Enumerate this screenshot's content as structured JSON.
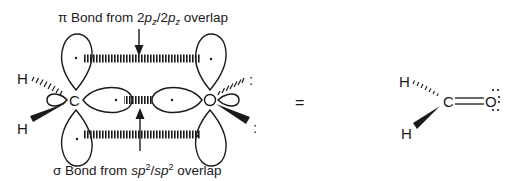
{
  "figure": {
    "pi_label": {
      "prefix": "π Bond from 2",
      "p1": "p",
      "sub1": "z",
      "slash": "/2",
      "p2": "p",
      "sub2": "z",
      "suffix": " overlap"
    },
    "sigma_label": {
      "prefix": "σ Bond from ",
      "sp1": "sp",
      "sup1": "2",
      "slash": "/",
      "sp2": "sp",
      "sup2": "2",
      "suffix": " overlap"
    },
    "orbital_model": {
      "carbon": "C",
      "oxygen": "O",
      "hydrogen_top": "H",
      "hydrogen_bottom": "H",
      "lone_pair_top": ":",
      "lone_pair_bottom": ":"
    },
    "equals": "=",
    "formaldehyde": {
      "carbon": "C",
      "oxygen": "O",
      "hydrogen_top": "H",
      "hydrogen_bottom": "H"
    },
    "colors": {
      "ink": "#1a1a1a",
      "background": "#ffffff"
    }
  }
}
